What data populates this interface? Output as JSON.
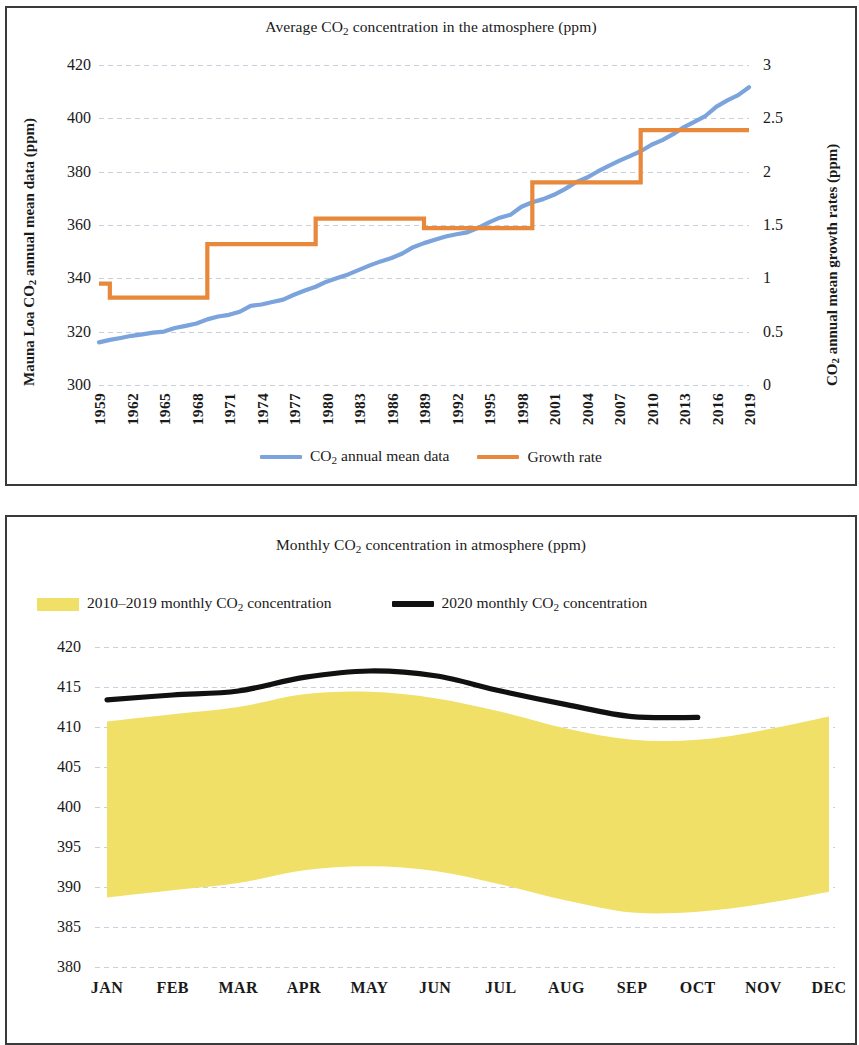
{
  "colors": {
    "co2_line": "#7BA3DC",
    "growth_line": "#E8883A",
    "band_2010s": "#F0E068",
    "line_2020": "#111111",
    "grid": "#c9cfdd",
    "frame": "#3a3a3a"
  },
  "chart_data": [
    {
      "type": "line",
      "title": "Average CO2 concentration in the atmosphere (ppm)",
      "title_parts": {
        "pre": "Average CO",
        "sub": "2",
        "post": " concentration in the atmosphere (ppm)"
      },
      "xlabel": "",
      "ylabel": "Mauna Loa CO2 annual mean data (ppm)",
      "ylabel_parts": {
        "pre": "Mauna Loa CO",
        "sub": "2",
        "post": " annual mean data (ppm)"
      },
      "y2label": "CO2 annual mean growth rates (ppm)",
      "y2label_parts": {
        "pre": "CO",
        "sub": "2",
        "post": " annual mean growth rates (ppm)"
      },
      "grid": true,
      "legend_position": "bottom",
      "xlim": [
        1959,
        2019
      ],
      "ylim": [
        300,
        420
      ],
      "y2lim": [
        0,
        3
      ],
      "yticks": [
        300,
        320,
        340,
        360,
        380,
        400,
        420
      ],
      "y2ticks": [
        0,
        0.5,
        1,
        1.5,
        2,
        2.5,
        3
      ],
      "xticks": [
        1959,
        1962,
        1965,
        1968,
        1971,
        1974,
        1977,
        1980,
        1983,
        1986,
        1989,
        1992,
        1995,
        1998,
        2001,
        2004,
        2007,
        2010,
        2013,
        2016,
        2019
      ],
      "x": [
        1959,
        1960,
        1961,
        1962,
        1963,
        1964,
        1965,
        1966,
        1967,
        1968,
        1969,
        1970,
        1971,
        1972,
        1973,
        1974,
        1975,
        1976,
        1977,
        1978,
        1979,
        1980,
        1981,
        1982,
        1983,
        1984,
        1985,
        1986,
        1987,
        1988,
        1989,
        1990,
        1991,
        1992,
        1993,
        1994,
        1995,
        1996,
        1997,
        1998,
        1999,
        2000,
        2001,
        2002,
        2003,
        2004,
        2005,
        2006,
        2007,
        2008,
        2009,
        2010,
        2011,
        2012,
        2013,
        2014,
        2015,
        2016,
        2017,
        2018,
        2019
      ],
      "series": [
        {
          "name": "CO2 annual mean data",
          "name_parts": {
            "pre": "CO",
            "sub": "2",
            "post": " annual mean data"
          },
          "axis": "left",
          "color": "#7BA3DC",
          "values": [
            315.98,
            316.91,
            317.64,
            318.45,
            318.99,
            319.62,
            320.04,
            321.37,
            322.18,
            323.05,
            324.62,
            325.68,
            326.32,
            327.46,
            329.68,
            330.19,
            331.12,
            332.03,
            333.84,
            335.41,
            336.84,
            338.76,
            340.12,
            341.48,
            343.15,
            344.87,
            346.35,
            347.61,
            349.31,
            351.69,
            353.2,
            354.45,
            355.7,
            356.54,
            357.21,
            358.96,
            360.97,
            362.74,
            363.88,
            366.84,
            368.54,
            369.71,
            371.32,
            373.45,
            375.98,
            377.7,
            379.98,
            382.09,
            384.02,
            385.83,
            387.64,
            390.1,
            391.85,
            394.06,
            396.74,
            398.81,
            400.96,
            404.41,
            406.76,
            408.72,
            411.66
          ]
        },
        {
          "name": "Growth rate",
          "axis": "right",
          "color": "#E8883A",
          "step": true,
          "values": [
            0.95,
            0.82,
            0.82,
            0.82,
            0.82,
            0.82,
            0.82,
            0.82,
            0.82,
            0.82,
            1.32,
            1.32,
            1.32,
            1.32,
            1.32,
            1.32,
            1.32,
            1.32,
            1.32,
            1.32,
            1.56,
            1.56,
            1.56,
            1.56,
            1.56,
            1.56,
            1.56,
            1.56,
            1.56,
            1.56,
            1.47,
            1.47,
            1.47,
            1.47,
            1.47,
            1.47,
            1.47,
            1.47,
            1.47,
            1.47,
            1.9,
            1.9,
            1.9,
            1.9,
            1.9,
            1.9,
            1.9,
            1.9,
            1.9,
            1.9,
            2.39,
            2.39,
            2.39,
            2.39,
            2.39,
            2.39,
            2.39,
            2.39,
            2.39,
            2.39,
            2.39
          ]
        }
      ],
      "legend": [
        {
          "label": "CO2 annual mean data",
          "label_parts": {
            "pre": "CO",
            "sub": "2",
            "post": " annual mean data"
          },
          "marker": "line",
          "color": "#7BA3DC"
        },
        {
          "label": "Growth rate",
          "label_parts": {
            "pre": "Growth rate",
            "sub": "",
            "post": ""
          },
          "marker": "line",
          "color": "#E8883A"
        }
      ]
    },
    {
      "type": "area",
      "title": "Monthly CO2 concentration in atmosphere (ppm)",
      "title_parts": {
        "pre": "Monthly CO",
        "sub": "2",
        "post": " concentration in atmosphere (ppm)"
      },
      "xlabel": "",
      "ylabel": "",
      "grid": true,
      "legend_position": "top",
      "ylim": [
        380,
        420
      ],
      "yticks": [
        380,
        385,
        390,
        395,
        400,
        405,
        410,
        415,
        420
      ],
      "categories": [
        "JAN",
        "FEB",
        "MAR",
        "APR",
        "MAY",
        "JUN",
        "JUL",
        "AUG",
        "SEP",
        "OCT",
        "NOV",
        "DEC"
      ],
      "series": [
        {
          "name": "2010-2019 monthly CO2 concentration",
          "name_parts": {
            "pre": "2010–2019 monthly CO",
            "sub": "2",
            "post": " concentration"
          },
          "type": "band",
          "color": "#F0E068",
          "upper": [
            410.7,
            411.6,
            412.5,
            414.1,
            414.4,
            413.6,
            411.9,
            409.8,
            408.4,
            408.4,
            409.6,
            411.3
          ],
          "lower": [
            388.7,
            389.6,
            390.5,
            392.1,
            392.6,
            392.0,
            390.3,
            388.3,
            386.8,
            386.9,
            387.9,
            389.4
          ]
        },
        {
          "name": "2020 monthly CO2 concentration",
          "name_parts": {
            "pre": "2020 monthly CO",
            "sub": "2",
            "post": " concentration"
          },
          "type": "line",
          "color": "#111111",
          "values": [
            413.4,
            414.0,
            414.5,
            416.2,
            417.0,
            416.4,
            414.5,
            412.8,
            411.3,
            411.2,
            null,
            null
          ]
        }
      ],
      "legend": [
        {
          "label": "2010-2019 monthly CO2 concentration",
          "label_parts": {
            "pre": "2010–2019 monthly CO",
            "sub": "2",
            "post": " concentration"
          },
          "marker": "box",
          "color": "#F0E068"
        },
        {
          "label": "2020 monthly CO2 concentration",
          "label_parts": {
            "pre": "2020 monthly CO",
            "sub": "2",
            "post": " concentration"
          },
          "marker": "line-thick",
          "color": "#111111"
        }
      ]
    }
  ]
}
